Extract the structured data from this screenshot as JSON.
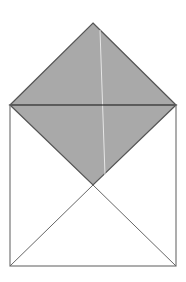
{
  "diagram": {
    "colors": {
      "background": "#ffffff",
      "flap_fill": "#a9a9a9",
      "stroke": "#555555",
      "body_stroke": "#777777",
      "fold_line": "#e6e6e6"
    },
    "points": {
      "apex": [
        93,
        23
      ],
      "top_left": [
        10,
        105
      ],
      "top_right": [
        176,
        105
      ],
      "center": [
        93,
        185
      ],
      "bottom_left": [
        10,
        266
      ],
      "bottom_right": [
        176,
        266
      ]
    }
  }
}
